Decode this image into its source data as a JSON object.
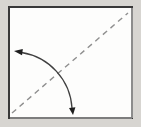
{
  "diagram": {
    "type": "origami-fold-step",
    "canvas": {
      "width": 141,
      "height": 127
    },
    "paper": {
      "x": 9,
      "y": 7,
      "width": 123,
      "height": 111,
      "border_width": 2
    },
    "paper_edge_right": {
      "x1": 132,
      "y1": 8,
      "x2": 132,
      "y2": 118
    },
    "paper_edge_bottom": {
      "x1": 10,
      "y1": 118,
      "x2": 132,
      "y2": 118
    },
    "fold_line": {
      "style": "dashed",
      "x1": 12,
      "y1": 113,
      "x2": 128,
      "y2": 13,
      "dash": "5.5 4.5",
      "width": 1.4
    },
    "fold_arrow": {
      "direction": "both",
      "arc_path": "M 21.5 52.5 A 60 60 0 0 1 72 108",
      "arc_width": 1.3,
      "left_head_points": "14,51 22,55.3 22.8,48.9",
      "down_head_points": "73,115 75.4,107.3 69,107.9"
    }
  },
  "colors": {
    "page_background": "#d7d5d1",
    "paper_fill": "#fdfdfc",
    "paper_border": "#383838",
    "paper_border_light_right": "#8c8c8c",
    "paper_border_light_bottom": "#7d7d7d",
    "fold_line": "#8f8f8f",
    "arrow_line": "#3f3f3f",
    "arrowhead": "#1e1e1e"
  }
}
